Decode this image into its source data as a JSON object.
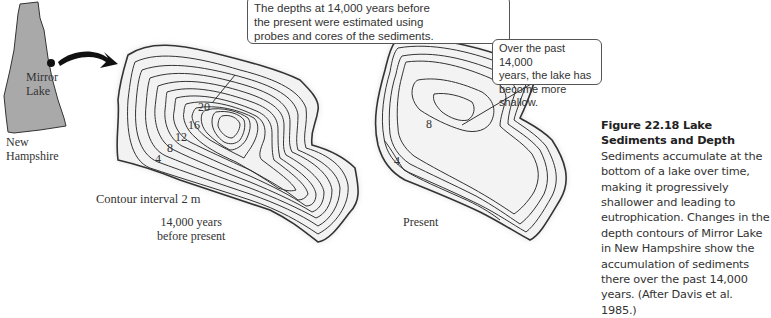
{
  "state_map": {
    "state_label": "New Hampshire",
    "state_label_line1": "New",
    "state_label_line2": "Hampshire",
    "lake_label_line1": "Mirror",
    "lake_label_line2": "Lake",
    "fill_color": "#a9a9a9"
  },
  "past_map": {
    "callout_line1": "The depths at 14,000 years before",
    "callout_line2": "the present were estimated using",
    "callout_line3": "probes and cores of the sediments.",
    "contour_labels": [
      "20",
      "16",
      "12",
      "8",
      "4"
    ],
    "contour_interval": "Contour interval 2 m",
    "time_label_line1": "14,000 years",
    "time_label_line2": "before present"
  },
  "present_map": {
    "callout_line1": "Over the past 14,000",
    "callout_line2": "years, the lake has",
    "callout_line3": "become more shallow.",
    "contour_labels": [
      "8",
      "4"
    ],
    "time_label": "Present"
  },
  "caption": {
    "figure_number": "Figure 22.18",
    "figure_title": "Lake Sediments and Depth",
    "body": "Sediments accumulate at the bottom of a lake over time, making it progressively shallower and leading to eutrophication. Changes in the depth contours of Mirror Lake in New Hampshire show the accumulation of sediments there over the past 14,000 years. (After Davis et al. 1985.)"
  }
}
